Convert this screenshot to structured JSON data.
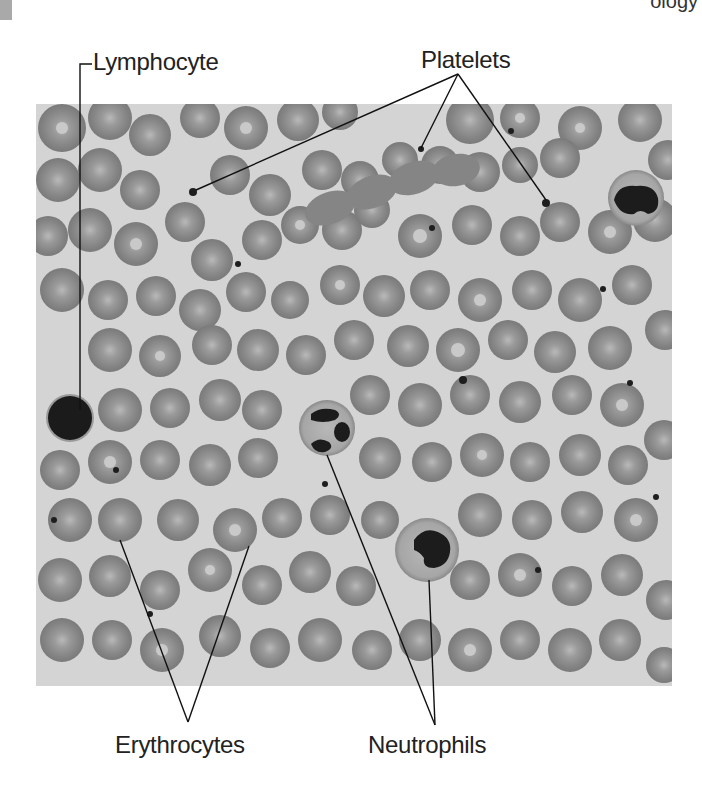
{
  "figure": {
    "header_fragment": "ology",
    "labels": {
      "lymphocyte": "Lymphocyte",
      "platelets": "Platelets",
      "erythrocytes": "Erythrocytes",
      "neutrophils": "Neutrophils"
    },
    "colors": {
      "plasma": "#d4d4d4",
      "erythrocyte": "#8c8c8c",
      "erythrocyte_center": "#bdbdbd",
      "nucleus": "#1e1e1e",
      "neutrophil_cytoplasm": "#a9a9a9",
      "leader_line": "#111111"
    }
  }
}
